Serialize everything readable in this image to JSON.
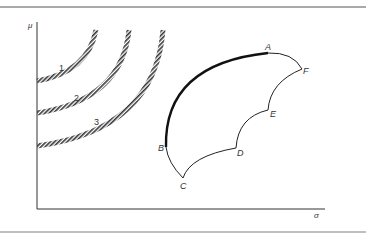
{
  "diagram": {
    "type": "mean-variance efficient frontier with indifference curves",
    "axes": {
      "y_label": "μ",
      "x_label": "σ"
    },
    "indifference_curves": [
      {
        "id": "1",
        "label": "1"
      },
      {
        "id": "2",
        "label": "2"
      },
      {
        "id": "3",
        "label": "3"
      }
    ],
    "points": [
      {
        "id": "A",
        "label": "A"
      },
      {
        "id": "B",
        "label": "B"
      },
      {
        "id": "C",
        "label": "C"
      },
      {
        "id": "D",
        "label": "D"
      },
      {
        "id": "E",
        "label": "E"
      },
      {
        "id": "F",
        "label": "F"
      }
    ],
    "efficient_frontier": "B to A (bold)",
    "colors": {
      "line": "#222222",
      "hatch": "#333333",
      "frame_top": "#555555",
      "frame_bottom": "#999999"
    }
  }
}
